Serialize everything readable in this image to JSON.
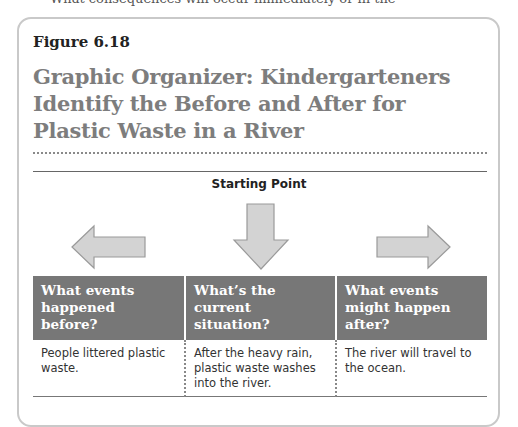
{
  "page": {
    "cut_off_text": "What consequences will occur immediately or in the"
  },
  "figure": {
    "label": "Figure 6.18",
    "title": "Graphic Organizer: Kindergarteners Identify the Before and After for Plastic Waste in a River"
  },
  "organizer": {
    "starting_point_label": "Starting Point",
    "arrows": [
      {
        "direction": "left",
        "icon": "arrow-left-icon"
      },
      {
        "direction": "down",
        "icon": "arrow-down-icon"
      },
      {
        "direction": "right",
        "icon": "arrow-right-icon"
      }
    ],
    "columns": [
      {
        "header": "What events happened before?",
        "content": "People littered plastic waste."
      },
      {
        "header": "What’s the current situation?",
        "content": "After the heavy rain, plastic waste washes into the river."
      },
      {
        "header": "What events might happen after?",
        "content": "The river will travel to the ocean."
      }
    ]
  },
  "colors": {
    "header_bg": "#777777",
    "title_text": "#7d7d7d",
    "arrow_fill": "#d3d3d3",
    "arrow_stroke": "#9a9a9a",
    "box_border": "#c9c9c9"
  }
}
